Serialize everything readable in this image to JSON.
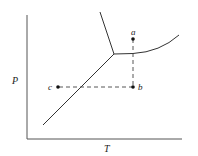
{
  "diagram": {
    "type": "phase-diagram",
    "axes": {
      "x_label": "T",
      "y_label": "P"
    },
    "points": [
      {
        "id": "a",
        "label": "a"
      },
      {
        "id": "b",
        "label": "b"
      },
      {
        "id": "c",
        "label": "c"
      }
    ],
    "curves": [
      {
        "id": "solid-liquid",
        "description": "fusion line from triple point upward"
      },
      {
        "id": "solid-gas",
        "description": "sublimation line from triple point downward"
      },
      {
        "id": "liquid-gas",
        "description": "vaporization curve from triple point rightward"
      }
    ],
    "paths": [
      {
        "from": "a",
        "to": "b",
        "style": "dashed"
      },
      {
        "from": "b",
        "to": "c",
        "style": "dashed"
      }
    ],
    "colors": {
      "line": "#333333",
      "background": "#ffffff"
    }
  }
}
